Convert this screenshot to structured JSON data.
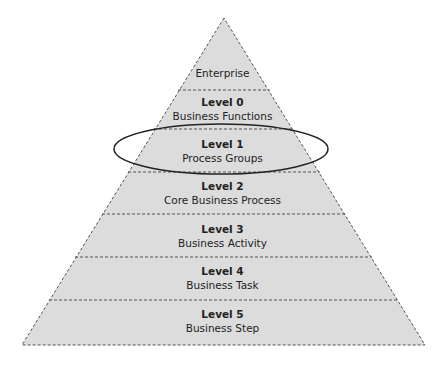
{
  "pyramid": {
    "fill_color": "#dcdcdc",
    "line_color": "#555555",
    "top": {
      "label": "Enterprise"
    },
    "levels": [
      {
        "title": "Level 0",
        "subtitle": "Business Functions"
      },
      {
        "title": "Level 1",
        "subtitle": "Process Groups"
      },
      {
        "title": "Level 2",
        "subtitle": "Core Business Process"
      },
      {
        "title": "Level 3",
        "subtitle": "Business Activity"
      },
      {
        "title": "Level 4",
        "subtitle": "Business Task"
      },
      {
        "title": "Level 5",
        "subtitle": "Business Step"
      }
    ],
    "highlighted_level": "Level 1"
  }
}
